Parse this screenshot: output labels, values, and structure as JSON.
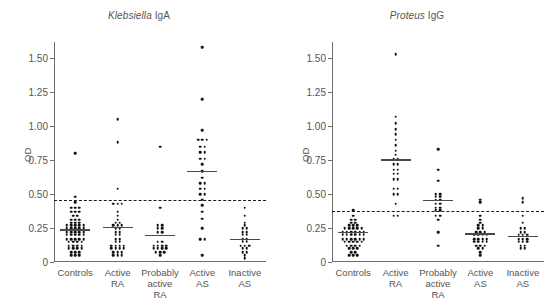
{
  "figure": {
    "ylabel": "OD",
    "y_ticks": [
      "0",
      "0.25",
      "0.50",
      "0.75",
      "1.00",
      "1.25",
      "1.50"
    ],
    "y_tick_values": [
      0,
      0.25,
      0.5,
      0.75,
      1.0,
      1.25,
      1.5
    ],
    "categories": [
      "Controls",
      "Active\nRA",
      "Probably\nactive\nRA",
      "Active\nAS",
      "Inactive\nAS"
    ]
  },
  "panels": [
    {
      "title_genus": "Klebsiella",
      "title_rest": " IgA"
    },
    {
      "title_genus": "Proteus",
      "title_rest": " IgG"
    }
  ],
  "chart_data": [
    {
      "type": "scatter",
      "title": "Klebsiella IgA",
      "xlabel": "",
      "ylabel": "OD",
      "ylim": [
        0,
        1.62
      ],
      "grid": false,
      "legend": "none",
      "categories": [
        "Controls",
        "Active RA",
        "Probably active RA",
        "Active AS",
        "Inactive AS"
      ],
      "cutoff_line": 0.46,
      "cutoff_style": "dashed",
      "means": [
        0.24,
        0.26,
        0.2,
        0.67,
        0.17
      ],
      "series": [
        {
          "name": "Controls",
          "values": [
            0.8,
            0.48,
            0.44,
            0.4,
            0.4,
            0.4,
            0.37,
            0.37,
            0.37,
            0.34,
            0.34,
            0.31,
            0.31,
            0.31,
            0.29,
            0.29,
            0.29,
            0.27,
            0.27,
            0.27,
            0.27,
            0.27,
            0.25,
            0.25,
            0.25,
            0.25,
            0.25,
            0.22,
            0.22,
            0.22,
            0.22,
            0.22,
            0.2,
            0.2,
            0.2,
            0.2,
            0.2,
            0.17,
            0.17,
            0.17,
            0.17,
            0.17,
            0.15,
            0.15,
            0.15,
            0.15,
            0.12,
            0.12,
            0.12,
            0.12,
            0.1,
            0.1,
            0.1,
            0.1,
            0.07,
            0.07,
            0.07,
            0.05,
            0.05,
            0.05
          ]
        },
        {
          "name": "Active RA",
          "values": [
            1.05,
            0.88,
            0.54,
            0.43,
            0.43,
            0.43,
            0.37,
            0.34,
            0.31,
            0.29,
            0.29,
            0.27,
            0.27,
            0.27,
            0.25,
            0.25,
            0.22,
            0.22,
            0.2,
            0.2,
            0.17,
            0.17,
            0.15,
            0.15,
            0.12,
            0.12,
            0.12,
            0.12,
            0.1,
            0.1,
            0.1,
            0.1,
            0.07,
            0.07,
            0.07,
            0.05,
            0.05,
            0.05
          ]
        },
        {
          "name": "Probably active RA",
          "values": [
            0.85,
            0.4,
            0.27,
            0.27,
            0.25,
            0.25,
            0.22,
            0.22,
            0.15,
            0.15,
            0.12,
            0.12,
            0.12,
            0.12,
            0.1,
            0.1,
            0.1,
            0.1,
            0.07,
            0.07,
            0.07,
            0.05
          ]
        },
        {
          "name": "Active AS",
          "values": [
            1.58,
            1.2,
            0.97,
            0.9,
            0.9,
            0.9,
            0.85,
            0.85,
            0.81,
            0.81,
            0.76,
            0.76,
            0.72,
            0.67,
            0.62,
            0.58,
            0.58,
            0.54,
            0.54,
            0.5,
            0.5,
            0.46,
            0.42,
            0.37,
            0.32,
            0.25,
            0.17,
            0.17,
            0.05
          ]
        },
        {
          "name": "Inactive AS",
          "values": [
            0.4,
            0.34,
            0.29,
            0.27,
            0.25,
            0.25,
            0.22,
            0.22,
            0.2,
            0.2,
            0.17,
            0.17,
            0.15,
            0.15,
            0.12,
            0.12,
            0.12,
            0.1,
            0.1,
            0.07,
            0.07,
            0.05,
            0.03
          ]
        }
      ]
    },
    {
      "type": "scatter",
      "title": "Proteus IgG",
      "xlabel": "",
      "ylabel": "OD",
      "ylim": [
        0,
        1.62
      ],
      "grid": false,
      "legend": "none",
      "categories": [
        "Controls",
        "Active RA",
        "Probably active RA",
        "Active AS",
        "Inactive AS"
      ],
      "cutoff_line": 0.375,
      "cutoff_style": "dashed",
      "means": [
        0.22,
        0.755,
        0.46,
        0.21,
        0.195
      ],
      "series": [
        {
          "name": "Controls",
          "values": [
            0.38,
            0.34,
            0.31,
            0.31,
            0.29,
            0.29,
            0.27,
            0.27,
            0.27,
            0.25,
            0.25,
            0.25,
            0.25,
            0.25,
            0.22,
            0.22,
            0.22,
            0.22,
            0.22,
            0.22,
            0.2,
            0.2,
            0.2,
            0.2,
            0.2,
            0.2,
            0.17,
            0.17,
            0.17,
            0.17,
            0.17,
            0.17,
            0.15,
            0.15,
            0.15,
            0.15,
            0.15,
            0.12,
            0.12,
            0.12,
            0.12,
            0.1,
            0.1,
            0.1,
            0.07,
            0.07,
            0.05,
            0.05,
            0.05
          ]
        },
        {
          "name": "Active RA",
          "values": [
            1.53,
            1.07,
            1.02,
            0.98,
            0.94,
            0.9,
            0.86,
            0.82,
            0.79,
            0.76,
            0.76,
            0.72,
            0.72,
            0.68,
            0.68,
            0.65,
            0.65,
            0.61,
            0.61,
            0.54,
            0.54,
            0.5,
            0.5,
            0.43,
            0.34,
            0.34
          ]
        },
        {
          "name": "Probably active RA",
          "values": [
            0.83,
            0.68,
            0.6,
            0.5,
            0.5,
            0.48,
            0.48,
            0.46,
            0.46,
            0.43,
            0.43,
            0.4,
            0.4,
            0.38,
            0.38,
            0.34,
            0.34,
            0.31,
            0.22,
            0.12
          ]
        },
        {
          "name": "Active AS",
          "values": [
            0.46,
            0.44,
            0.34,
            0.31,
            0.29,
            0.27,
            0.27,
            0.25,
            0.25,
            0.22,
            0.22,
            0.22,
            0.2,
            0.2,
            0.2,
            0.2,
            0.17,
            0.17,
            0.17,
            0.17,
            0.15,
            0.15,
            0.15,
            0.15,
            0.12,
            0.12,
            0.12,
            0.1,
            0.1,
            0.07,
            0.05
          ]
        },
        {
          "name": "Inactive AS",
          "values": [
            0.47,
            0.44,
            0.34,
            0.29,
            0.25,
            0.25,
            0.22,
            0.22,
            0.2,
            0.2,
            0.2,
            0.17,
            0.17,
            0.17,
            0.15,
            0.15,
            0.15,
            0.12,
            0.12,
            0.1,
            0.1
          ]
        }
      ]
    }
  ]
}
